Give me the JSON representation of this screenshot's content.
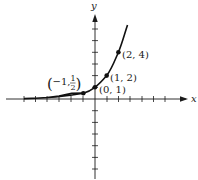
{
  "diagram": {
    "function": "y = 2^x",
    "axes": {
      "x_label": "x",
      "y_label": "y",
      "tick_spacing_px": 11.7,
      "origin_px": [
        95,
        99
      ],
      "color": "#1a1a1a"
    },
    "points": [
      {
        "x": -1,
        "y": 0.5,
        "label_prefix": "(−1, ",
        "label_num": "1",
        "label_den": "2",
        "label_suffix": ")"
      },
      {
        "x": 0,
        "y": 1,
        "label": "(0, 1)"
      },
      {
        "x": 1,
        "y": 2,
        "label": "(1, 2)"
      },
      {
        "x": 2,
        "y": 4,
        "label": "(2, 4)"
      }
    ],
    "curve_color": "#111111"
  }
}
